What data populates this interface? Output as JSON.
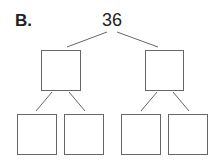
{
  "diagram": {
    "label": "B.",
    "root_value": "36",
    "type": "factor-tree",
    "levels": [
      {
        "level": 1,
        "boxes": [
          "",
          ""
        ]
      },
      {
        "level": 2,
        "boxes": [
          "",
          "",
          "",
          ""
        ]
      }
    ],
    "colors": {
      "stroke": "#666666",
      "text": "#222222"
    }
  }
}
